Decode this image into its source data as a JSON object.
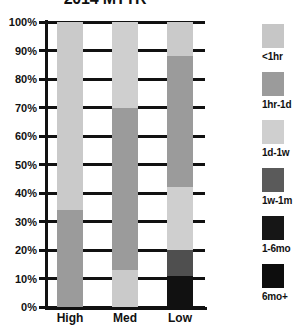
{
  "chart_data": {
    "type": "bar",
    "subtype": "stacked-100-percent",
    "title": "2014 MTTR",
    "xlabel": "",
    "ylabel": "",
    "categories": [
      "High",
      "Med",
      "Low"
    ],
    "ylim": [
      0,
      100
    ],
    "ytick_labels": [
      "0%",
      "10%",
      "20%",
      "30%",
      "40%",
      "50%",
      "60%",
      "70%",
      "80%",
      "90%",
      "100%"
    ],
    "ytick_values": [
      0,
      10,
      20,
      30,
      40,
      50,
      60,
      70,
      80,
      90,
      100
    ],
    "grid": true,
    "legend_position": "right",
    "series": [
      {
        "name": "<1hr",
        "color": "#c6c6c6",
        "values": [
          0,
          0,
          0
        ]
      },
      {
        "name": "1hr-1d",
        "color": "#9b9b9b",
        "values": [
          0,
          0,
          0
        ]
      },
      {
        "name": "1d-1w",
        "color": "#cfcfcf",
        "values": [
          66,
          30,
          12
        ]
      },
      {
        "name": "1w-1m",
        "color": "#5a5a5a",
        "values": [
          34,
          57,
          46
        ]
      },
      {
        "name": "1-6mo",
        "color": "#161616",
        "values": [
          0,
          13,
          22
        ]
      },
      {
        "name": "6mo+",
        "color": "#0d0d0d",
        "values": [
          0,
          0,
          20
        ]
      }
    ],
    "stacks": {
      "High": [
        {
          "label": "1d-1w",
          "from": 34,
          "to": 100,
          "value": 66,
          "color": "#cacaca"
        },
        {
          "label": "1w-1m",
          "from": 0,
          "to": 34,
          "value": 34,
          "color": "#9b9b9b"
        }
      ],
      "Med": [
        {
          "label": "1d-1w",
          "from": 70,
          "to": 100,
          "value": 30,
          "color": "#cfcfcf"
        },
        {
          "label": "1w-1m",
          "from": 13,
          "to": 70,
          "value": 57,
          "color": "#9b9b9b"
        },
        {
          "label": "1-6mo",
          "from": 0,
          "to": 13,
          "value": 13,
          "color": "#cacaca"
        }
      ],
      "Low": [
        {
          "label": "1d-1w",
          "from": 88,
          "to": 100,
          "value": 12,
          "color": "#cacaca"
        },
        {
          "label": "1w-1m",
          "from": 42,
          "to": 88,
          "value": 46,
          "color": "#9b9b9b"
        },
        {
          "label": "1d-1w2",
          "from": 20,
          "to": 42,
          "value": 22,
          "color": "#cfcfcf"
        },
        {
          "label": "1-6mo",
          "from": 11,
          "to": 20,
          "value": 9,
          "color": "#4f4f4f"
        },
        {
          "label": "6mo+",
          "from": 0,
          "to": 11,
          "value": 11,
          "color": "#111111"
        }
      ]
    }
  },
  "legend": {
    "items": [
      {
        "label": "<1hr",
        "color": "#c6c6c6"
      },
      {
        "label": "1hr-1d",
        "color": "#9b9b9b"
      },
      {
        "label": "1d-1w",
        "color": "#cfcfcf"
      },
      {
        "label": "1w-1m",
        "color": "#5a5a5a"
      },
      {
        "label": "1-6mo",
        "color": "#161616"
      },
      {
        "label": "6mo+",
        "color": "#0d0d0d"
      }
    ]
  }
}
